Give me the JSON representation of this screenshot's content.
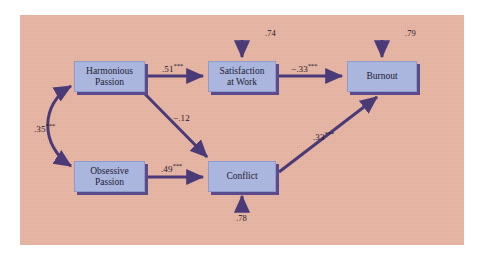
{
  "figure": {
    "type": "path-diagram",
    "background_color": "#e7b4a2",
    "node_fill_color": "#aab6dd",
    "arrow_color": "#4a3a78",
    "panel": {
      "x": 20,
      "y": 15,
      "width": 444,
      "height": 230
    }
  },
  "nodes": [
    {
      "id": "harmonious_passion",
      "label_line1": "Harmonious",
      "label_line2": "Passion",
      "x": 74,
      "y": 61,
      "width": 71,
      "height": 31
    },
    {
      "id": "satisfaction_at_work",
      "label_line1": "Satisfaction",
      "label_line2": "at Work",
      "x": 208,
      "y": 61,
      "width": 68,
      "height": 31
    },
    {
      "id": "burnout",
      "label_line1": "Burnout",
      "label_line2": "",
      "x": 347,
      "y": 61,
      "width": 70,
      "height": 31
    },
    {
      "id": "obsessive_passion",
      "label_line1": "Obsessive",
      "label_line2": "Passion",
      "x": 74,
      "y": 161,
      "width": 71,
      "height": 31
    },
    {
      "id": "conflict",
      "label_line1": "Conflict",
      "label_line2": "",
      "x": 208,
      "y": 161,
      "width": 68,
      "height": 31
    }
  ],
  "paths": [
    {
      "id": "hp-to-sat",
      "from": "harmonious_passion",
      "to": "satisfaction_at_work",
      "coefficient": ".51",
      "significance": "***",
      "label_x": 162,
      "label_y": 62
    },
    {
      "id": "sat-to-burnout",
      "from": "satisfaction_at_work",
      "to": "burnout",
      "coefficient": "−.33",
      "significance": "***",
      "label_x": 291,
      "label_y": 62
    },
    {
      "id": "hp-to-conflict",
      "from": "harmonious_passion",
      "to": "conflict",
      "coefficient": "−.12",
      "significance": "",
      "label_x": 173,
      "label_y": 111
    },
    {
      "id": "op-to-conflict",
      "from": "obsessive_passion",
      "to": "conflict",
      "coefficient": ".49",
      "significance": "***",
      "label_x": 161,
      "label_y": 162
    },
    {
      "id": "conflict-to-burnout",
      "from": "conflict",
      "to": "burnout",
      "coefficient": ".33",
      "significance": "***",
      "label_x": 313,
      "label_y": 130
    },
    {
      "id": "hp-op-correlation",
      "from": "harmonious_passion",
      "to": "obsessive_passion",
      "coefficient": ".35",
      "significance": "***",
      "label_x": 34,
      "label_y": 122,
      "arrow_type": "double-headed-curve"
    }
  ],
  "disturbances": [
    {
      "id": "disturbance-satisfaction",
      "target": "satisfaction_at_work",
      "value": ".74",
      "label_x": 265,
      "label_y": 28,
      "direction": "down"
    },
    {
      "id": "disturbance-burnout",
      "target": "burnout",
      "value": ".79",
      "label_x": 405,
      "label_y": 28,
      "direction": "down"
    },
    {
      "id": "disturbance-conflict",
      "target": "conflict",
      "value": ".78",
      "label_x": 236,
      "label_y": 213,
      "direction": "up"
    }
  ]
}
